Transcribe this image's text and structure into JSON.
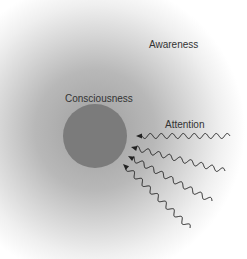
{
  "labels": {
    "awareness": "Awareness",
    "consciousness": "Consciousness",
    "attention": "Attention"
  },
  "colors": {
    "circle": "#7b7b7b",
    "arrow": "#222222",
    "field_center": "#9e9e9e"
  },
  "arrows": [
    {
      "from": [
        230,
        136
      ],
      "to": [
        136,
        136
      ]
    },
    {
      "from": [
        225,
        171
      ],
      "to": [
        131,
        147
      ]
    },
    {
      "from": [
        212,
        201
      ],
      "to": [
        128,
        156
      ]
    },
    {
      "from": [
        190,
        228
      ],
      "to": [
        123,
        164
      ]
    }
  ]
}
